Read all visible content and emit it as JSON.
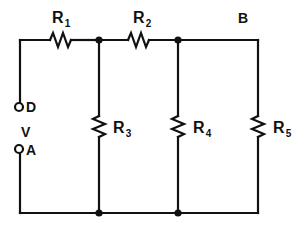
{
  "diagram": {
    "type": "electrical-schematic",
    "stroke_color": "#111111",
    "background_color": "#ffffff"
  },
  "resistors": [
    {
      "id": "R1",
      "base": "R",
      "subscript": "1",
      "orientation": "horizontal",
      "label_x": 52,
      "label_y": 10
    },
    {
      "id": "R2",
      "base": "R",
      "subscript": "2",
      "orientation": "horizontal",
      "label_x": 133,
      "label_y": 10
    },
    {
      "id": "R3",
      "base": "R",
      "subscript": "3",
      "orientation": "vertical",
      "label_x": 113,
      "label_y": 120
    },
    {
      "id": "R4",
      "base": "R",
      "subscript": "4",
      "orientation": "vertical",
      "label_x": 193,
      "label_y": 120
    },
    {
      "id": "R5",
      "base": "R",
      "subscript": "5",
      "orientation": "vertical",
      "label_x": 273,
      "label_y": 120
    }
  ],
  "nodes": {
    "b_label": "B",
    "d_label": "D",
    "a_label": "A",
    "v_label": "V"
  },
  "terminals": [
    {
      "name": "D",
      "label": "D",
      "cx": 18,
      "cy": 107
    },
    {
      "name": "A",
      "label": "A",
      "cx": 18,
      "cy": 149
    }
  ],
  "junction_dots": [
    {
      "x": 99,
      "y": 40
    },
    {
      "x": 178,
      "y": 40
    },
    {
      "x": 99,
      "y": 213
    },
    {
      "x": 178,
      "y": 213
    }
  ]
}
